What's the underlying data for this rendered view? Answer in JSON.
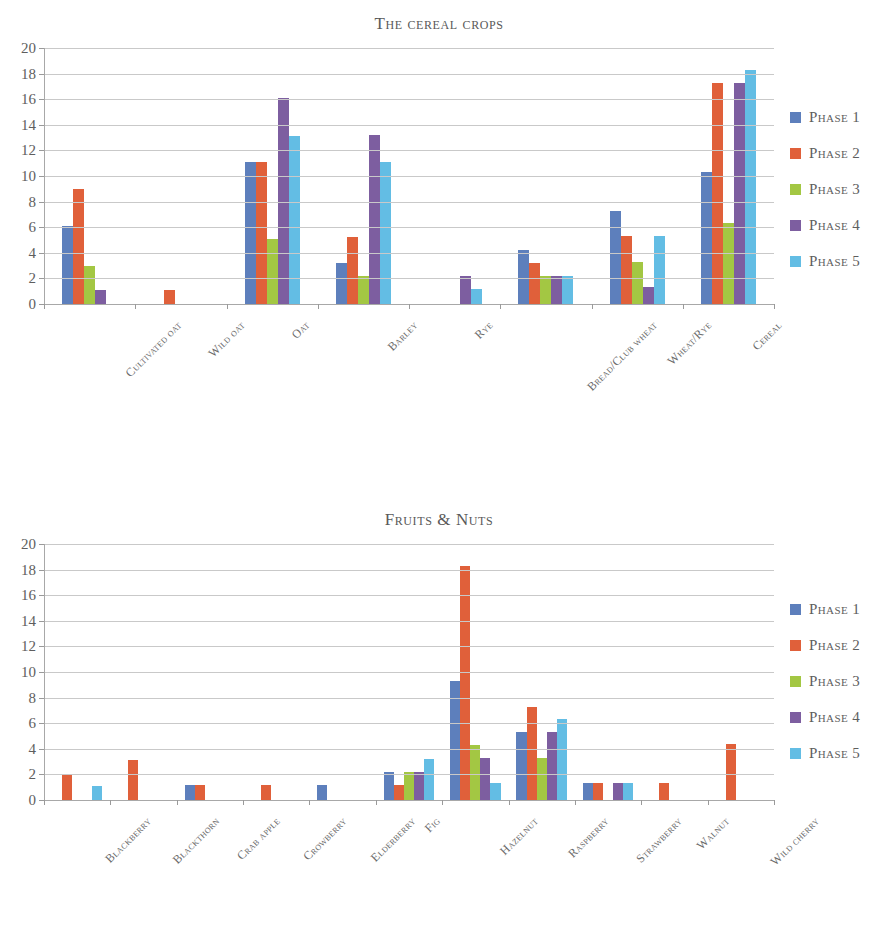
{
  "page": {
    "background": "#ffffff"
  },
  "palette": {
    "phase1": "#5d7fbc",
    "phase2": "#e0603a",
    "phase3": "#a3c743",
    "phase4": "#7d5ea0",
    "phase5": "#63bde4",
    "gridline": "#c9c9c9",
    "axis": "#a8a8a8",
    "text": "#5e5e5e"
  },
  "legend_labels": [
    "Phase 1",
    "Phase 2",
    "Phase 3",
    "Phase 4",
    "Phase 5"
  ],
  "y_ticks": [
    "0",
    "2",
    "4",
    "6",
    "8",
    "10",
    "12",
    "14",
    "16",
    "18",
    "20"
  ],
  "chart_data": [
    {
      "type": "bar",
      "id": "cereal-crops",
      "title": "The cereal crops",
      "xlabel": "",
      "ylabel": "",
      "ylim": [
        0,
        20
      ],
      "ytick_step": 2,
      "grid": true,
      "legend_position": "right",
      "categories": [
        "Cultivated oat",
        "Wild oat",
        "Oat",
        "Barley",
        "Rye",
        "Bread/Club wheat",
        "Wheat/Rye",
        "Cereal"
      ],
      "series": [
        {
          "name": "Phase 1",
          "color": "#5d7fbc",
          "values": [
            6.1,
            0,
            11.1,
            3.2,
            0,
            4.2,
            7.3,
            10.3
          ]
        },
        {
          "name": "Phase 2",
          "color": "#e0603a",
          "values": [
            9.0,
            1.1,
            11.1,
            5.2,
            0,
            3.2,
            5.3,
            17.3
          ]
        },
        {
          "name": "Phase 3",
          "color": "#a3c743",
          "values": [
            3.0,
            0,
            5.1,
            2.2,
            0,
            2.2,
            3.3,
            6.3
          ]
        },
        {
          "name": "Phase 4",
          "color": "#7d5ea0",
          "values": [
            1.1,
            0,
            16.1,
            13.2,
            2.2,
            2.2,
            1.3,
            17.3
          ]
        },
        {
          "name": "Phase 5",
          "color": "#63bde4",
          "values": [
            0,
            0,
            13.1,
            11.1,
            1.2,
            2.2,
            5.3,
            18.3
          ]
        }
      ]
    },
    {
      "type": "bar",
      "id": "fruits-nuts",
      "title": "Fruits & Nuts",
      "xlabel": "",
      "ylabel": "",
      "ylim": [
        0,
        20
      ],
      "ytick_step": 2,
      "grid": true,
      "legend_position": "right",
      "categories": [
        "Blackberry",
        "Blackthorn",
        "Crab apple",
        "Crowberry",
        "Elderberry",
        "Fig",
        "Hazelnut",
        "Raspberry",
        "Strawberry",
        "Walnut",
        "Wild cherry"
      ],
      "series": [
        {
          "name": "Phase 1",
          "color": "#5d7fbc",
          "values": [
            0,
            0,
            1.2,
            0,
            1.2,
            2.2,
            9.3,
            5.3,
            1.3,
            0,
            0
          ]
        },
        {
          "name": "Phase 2",
          "color": "#e0603a",
          "values": [
            2.0,
            3.1,
            1.2,
            1.2,
            0,
            1.2,
            18.3,
            7.3,
            1.3,
            1.3,
            4.4
          ]
        },
        {
          "name": "Phase 3",
          "color": "#a3c743",
          "values": [
            0,
            0,
            0,
            0,
            0,
            2.2,
            4.3,
            3.3,
            0,
            0,
            0
          ]
        },
        {
          "name": "Phase 4",
          "color": "#7d5ea0",
          "values": [
            0,
            0,
            0,
            0,
            0,
            2.2,
            3.3,
            5.3,
            1.3,
            0,
            0
          ]
        },
        {
          "name": "Phase 5",
          "color": "#63bde4",
          "values": [
            1.1,
            0,
            0,
            0,
            0,
            3.2,
            1.3,
            6.3,
            1.3,
            0,
            0
          ]
        }
      ]
    }
  ]
}
